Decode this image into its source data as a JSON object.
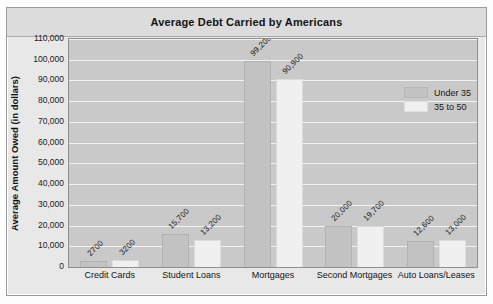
{
  "chart_data": {
    "type": "bar",
    "title": "Average Debt Carried by Americans",
    "xlabel": "",
    "ylabel": "Average Amount Owed (in dollars)",
    "categories": [
      "Credit Cards",
      "Student Loans",
      "Mortgages",
      "Second Mortgages",
      "Auto Loans/Leases"
    ],
    "series": [
      {
        "name": "Under 35",
        "values": [
          2700,
          15700,
          99200,
          20000,
          12600
        ],
        "color": "#c2c2c2"
      },
      {
        "name": "35 to 50",
        "values": [
          3200,
          13200,
          90900,
          19700,
          13000
        ],
        "color": "#f0f0f0"
      }
    ],
    "value_labels": [
      [
        "2700",
        "15,700",
        "99,200",
        "20,000",
        "12,600"
      ],
      [
        "3200",
        "13,200",
        "90,900",
        "19,700",
        "13,000"
      ]
    ],
    "ylim": [
      0,
      110000
    ],
    "ytick_values": [
      0,
      10000,
      20000,
      30000,
      40000,
      50000,
      60000,
      70000,
      80000,
      90000,
      100000,
      110000
    ],
    "ytick_labels": [
      "0",
      "10,000",
      "20,000",
      "30,000",
      "40,000",
      "50,000",
      "60,000",
      "70,000",
      "80,000",
      "90,000",
      "100,000",
      "110,000"
    ],
    "grid": true,
    "legend_position": "upper right",
    "plot_background": "#c9c9c9",
    "gridline_color": "#f2f2f2",
    "title_band_color": "#dcdcdc",
    "frame_color": "#e8e8e8"
  }
}
